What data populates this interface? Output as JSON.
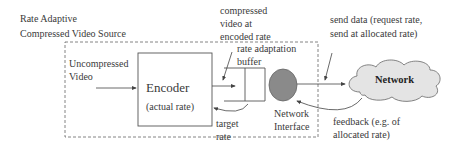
{
  "title": {
    "line1": "Rate Adaptive",
    "line2": "Compressed Video Source"
  },
  "labels": {
    "uncompressed_line1": "Uncompressed",
    "uncompressed_line2": "Video",
    "encoder": "Encoder",
    "encoder_sub": "(actual rate)",
    "compressed_line1": "compressed",
    "compressed_line2": "video at",
    "compressed_line3": "encoded rate",
    "buffer_line1": "rate adaptation",
    "buffer_line2": "buffer",
    "target_line1": "target",
    "target_line2": "rate",
    "netif_line1": "Network",
    "netif_line2": "Interface",
    "send_line1": "send data (request rate,",
    "send_line2": "send at allocated rate)",
    "network": "Network",
    "feedback_line1": "feedback (e.g. of",
    "feedback_line2": "allocated rate)"
  },
  "colors": {
    "line": "#555555",
    "interface_fill": "#8a8a8a",
    "cloud_fill": "#e4e4e4"
  }
}
